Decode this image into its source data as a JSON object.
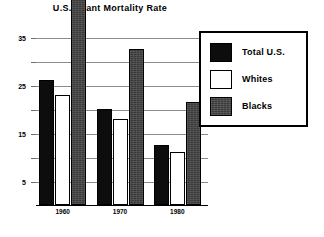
{
  "chart_data": {
    "type": "bar",
    "title": "U.S. Infant Mortality Rate",
    "xlabel": "",
    "ylabel": "",
    "categories": [
      "1960",
      "1970",
      "1980"
    ],
    "series": [
      {
        "name": "Total U.S.",
        "values": [
          26,
          20,
          12.6
        ],
        "color": "#0d0d0d"
      },
      {
        "name": "Whites",
        "values": [
          23,
          18,
          11
        ],
        "color": "#ffffff"
      },
      {
        "name": "Blacks",
        "values": [
          44.5,
          32.5,
          21.5
        ],
        "color": "#3a3a3a"
      }
    ],
    "ylim": [
      0,
      40
    ],
    "yticks": [
      5,
      10,
      15,
      20,
      25,
      30,
      35
    ],
    "ytick_labels": [
      "5",
      "",
      "15",
      "",
      "25",
      "",
      "35"
    ],
    "grid": true,
    "legend_position": "top-right"
  },
  "legend": {
    "items": [
      {
        "label": "Total U.S.",
        "swatch": "total"
      },
      {
        "label": "Whites",
        "swatch": "whites"
      },
      {
        "label": "Blacks",
        "swatch": "blacks"
      }
    ]
  }
}
